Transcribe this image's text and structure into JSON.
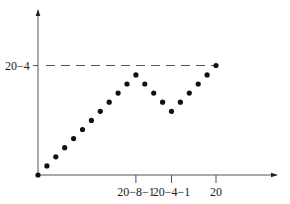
{
  "chart_data": {
    "type": "scatter",
    "title": "",
    "xlabel": "",
    "ylabel": "",
    "x_ticks": [
      {
        "value": 11,
        "label": "20−8−1"
      },
      {
        "value": 15,
        "label": "20−4−1"
      },
      {
        "value": 20,
        "label": "20"
      }
    ],
    "y_ticks": [
      {
        "value": 12,
        "label": "20−4"
      }
    ],
    "reference_line": {
      "orientation": "horizontal",
      "y": 12,
      "label": "20−4",
      "style": "dashed",
      "from_x": 0,
      "to_x": 20
    },
    "series": [
      {
        "name": "points",
        "x": [
          0,
          1,
          2,
          3,
          4,
          5,
          6,
          7,
          8,
          9,
          10,
          11,
          12,
          13,
          14,
          15,
          16,
          17,
          18,
          19,
          20
        ],
        "y": [
          0,
          1,
          2,
          3,
          4,
          5,
          6,
          7,
          8,
          9,
          10,
          11,
          10,
          9,
          8,
          7,
          8,
          9,
          10,
          11,
          12
        ]
      }
    ],
    "xlim": [
      0,
      27
    ],
    "ylim": [
      0,
      18
    ],
    "grid": false,
    "legend": null,
    "axes": {
      "arrows": true,
      "origin_point": true
    }
  },
  "colors": {
    "axis": "#555555",
    "points": "#111111",
    "dashed": "#555555",
    "text": "#222222"
  }
}
